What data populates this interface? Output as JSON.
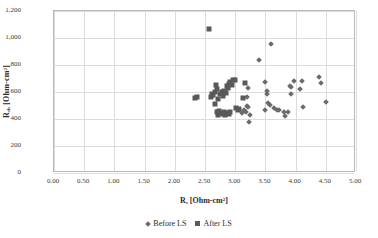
{
  "chart_data": {
    "type": "scatter",
    "title": "",
    "xlabel": "R_s [Ohm-cm2]",
    "ylabel": "R_sh [Ohm-cm2]",
    "xlabel_parts": {
      "base": "R",
      "sub": "s",
      "unit_pre": " [Ohm-cm",
      "sup": "2",
      "unit_post": "]"
    },
    "ylabel_parts": {
      "base": "R",
      "sub": "sh",
      "unit_pre": " [Ohm-cm",
      "sup": "2",
      "unit_post": "]"
    },
    "xlim": [
      0.0,
      5.0
    ],
    "ylim": [
      0,
      1200
    ],
    "xticks": [
      "0.00",
      "0.50",
      "1.00",
      "1.50",
      "2.00",
      "2.50",
      "3.00",
      "3.50",
      "4.00",
      "4.50",
      "5.00"
    ],
    "xtick_values": [
      0.0,
      0.5,
      1.0,
      1.5,
      2.0,
      2.5,
      3.0,
      3.5,
      4.0,
      4.5,
      5.0
    ],
    "yticks": [
      "0",
      "200",
      "400",
      "600",
      "800",
      "1,000",
      "1,200"
    ],
    "ytick_values": [
      0,
      200,
      400,
      600,
      800,
      1000,
      1200
    ],
    "grid": true,
    "legend_position": "bottom",
    "marker_color_before": "#6b6b6b",
    "marker_color_after": "#595959",
    "series": [
      {
        "name": "Before LS",
        "marker": "diamond",
        "points": [
          [
            3.22,
            630
          ],
          [
            3.2,
            565
          ],
          [
            3.19,
            500
          ],
          [
            3.21,
            490
          ],
          [
            3.18,
            455
          ],
          [
            3.24,
            432
          ],
          [
            3.23,
            375
          ],
          [
            3.12,
            443
          ],
          [
            3.15,
            470
          ],
          [
            3.4,
            838
          ],
          [
            3.6,
            957
          ],
          [
            3.49,
            675
          ],
          [
            3.52,
            608
          ],
          [
            3.53,
            585
          ],
          [
            3.55,
            520
          ],
          [
            3.58,
            505
          ],
          [
            3.5,
            465
          ],
          [
            3.64,
            478
          ],
          [
            3.7,
            470
          ],
          [
            3.73,
            468
          ],
          [
            3.8,
            450
          ],
          [
            3.83,
            425
          ],
          [
            3.88,
            450
          ],
          [
            3.9,
            648
          ],
          [
            3.92,
            640
          ],
          [
            3.93,
            588
          ],
          [
            3.97,
            685
          ],
          [
            4.08,
            622
          ],
          [
            4.1,
            685
          ],
          [
            4.12,
            492
          ],
          [
            4.38,
            710
          ],
          [
            4.42,
            665
          ],
          [
            4.5,
            528
          ]
        ]
      },
      {
        "name": "After LS",
        "marker": "square",
        "points": [
          [
            2.33,
            552
          ],
          [
            2.36,
            560
          ],
          [
            2.56,
            1068
          ],
          [
            2.62,
            588
          ],
          [
            2.64,
            575
          ],
          [
            2.66,
            598
          ],
          [
            2.6,
            562
          ],
          [
            2.68,
            655
          ],
          [
            2.7,
            620
          ],
          [
            2.72,
            545
          ],
          [
            2.67,
            508
          ],
          [
            2.75,
            585
          ],
          [
            2.78,
            600
          ],
          [
            2.8,
            572
          ],
          [
            2.82,
            610
          ],
          [
            2.85,
            592
          ],
          [
            2.87,
            648
          ],
          [
            2.88,
            628
          ],
          [
            2.9,
            660
          ],
          [
            2.92,
            672
          ],
          [
            2.95,
            650
          ],
          [
            2.97,
            688
          ],
          [
            3.0,
            690
          ],
          [
            2.74,
            462
          ],
          [
            2.76,
            448
          ],
          [
            2.79,
            440
          ],
          [
            2.81,
            452
          ],
          [
            2.83,
            430
          ],
          [
            2.86,
            445
          ],
          [
            2.89,
            438
          ],
          [
            2.91,
            455
          ],
          [
            2.7,
            452
          ],
          [
            2.72,
            430
          ],
          [
            3.02,
            478
          ],
          [
            3.05,
            470
          ],
          [
            3.13,
            558
          ],
          [
            3.16,
            665
          ],
          [
            3.06,
            472
          ]
        ]
      }
    ]
  },
  "legend": {
    "items": [
      {
        "label": "Before LS",
        "marker": "diamond"
      },
      {
        "label": "After LS",
        "marker": "square"
      }
    ]
  }
}
